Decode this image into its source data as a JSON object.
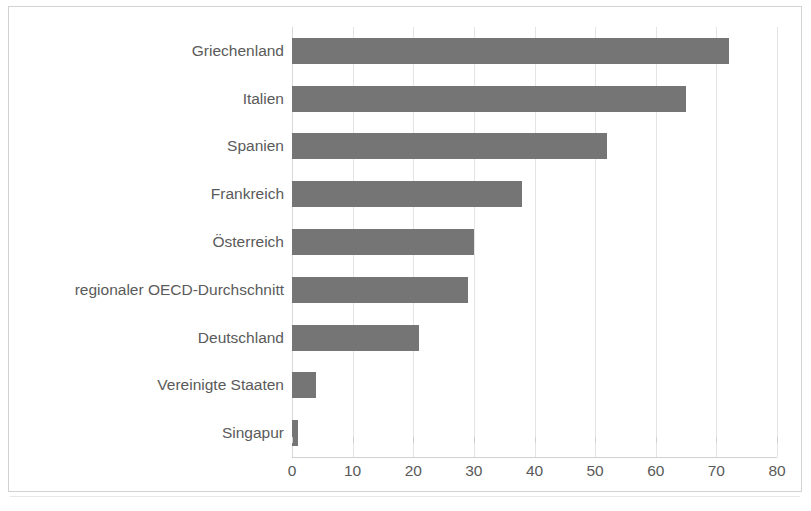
{
  "chart_data": {
    "type": "bar",
    "orientation": "horizontal",
    "title": "",
    "subtitle": "",
    "xlabel": "",
    "ylabel": "",
    "categories": [
      "Griechenland",
      "Italien",
      "Spanien",
      "Frankreich",
      "Österreich",
      "regionaler OECD-Durchschnitt",
      "Deutschland",
      "Vereinigte Staaten",
      "Singapur"
    ],
    "values": [
      72,
      65,
      52,
      38,
      30,
      29,
      21,
      4,
      1
    ],
    "xlim": [
      0,
      80
    ],
    "xticks": [
      0,
      10,
      20,
      30,
      40,
      50,
      60,
      70,
      80
    ],
    "xtick_labels": [
      "0",
      "10",
      "20",
      "30",
      "40",
      "50",
      "60",
      "70",
      "80"
    ],
    "grid": "vertical",
    "legend": "none",
    "bar_color": "#757575",
    "text_color": "#5a5a5a",
    "gridline_color": "#e4e4e4",
    "frame_color": "#d2d2d2",
    "background": "#ffffff"
  },
  "figure": {
    "border_color": "#d2d2d2"
  }
}
